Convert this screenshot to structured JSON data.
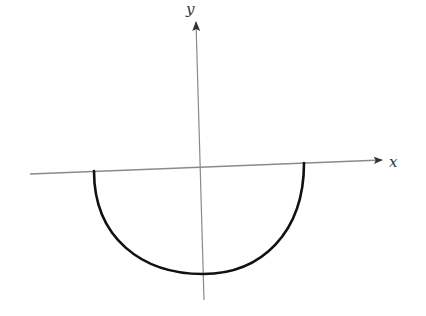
{
  "diagram": {
    "type": "coordinate-plot",
    "axes": {
      "x_label": "x",
      "y_label": "y"
    },
    "curve": {
      "shape": "lower-semicircle",
      "color": "#111111"
    },
    "colors": {
      "axis": "#888888",
      "curve": "#111111",
      "arrow": "#333333"
    }
  }
}
